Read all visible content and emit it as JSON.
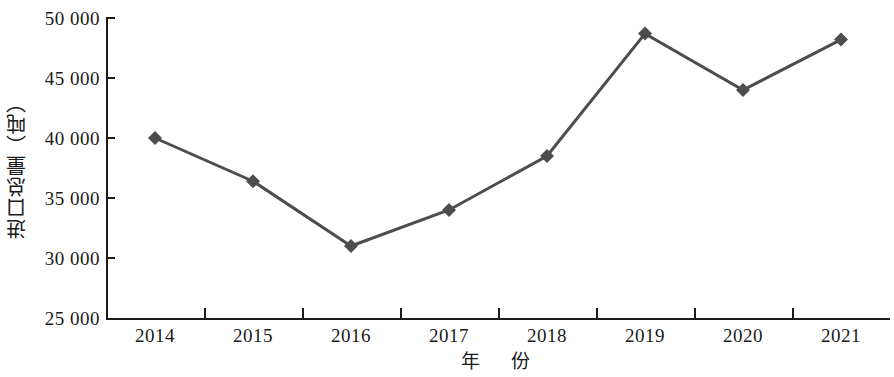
{
  "chart_data": {
    "type": "line",
    "title": "",
    "xlabel": "年　份",
    "ylabel": "进口总量（吨）",
    "categories": [
      "2014",
      "2015",
      "2016",
      "2017",
      "2018",
      "2019",
      "2020",
      "2021"
    ],
    "values": [
      40000,
      36400,
      31000,
      34000,
      38500,
      48700,
      44000,
      48200
    ],
    "series": [
      {
        "name": "进口总量",
        "values": [
          40000,
          36400,
          31000,
          34000,
          38500,
          48700,
          44000,
          48200
        ]
      }
    ],
    "ylim": [
      25000,
      50000
    ],
    "ytick_values": [
      25000,
      30000,
      35000,
      40000,
      45000,
      50000
    ],
    "ytick_labels": [
      "25 000",
      "30 000",
      "35 000",
      "40 000",
      "45 000",
      "50 000"
    ],
    "grid": false,
    "legend": "none",
    "marker": "diamond",
    "line_color": "#4d4d4d",
    "marker_color": "#4d4d4d",
    "axis_color": "#1c1c1c",
    "background_color": "#ffffff",
    "line_width": 3
  }
}
